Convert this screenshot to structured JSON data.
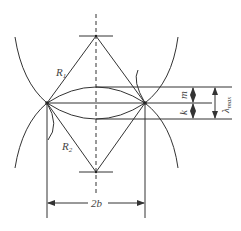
{
  "diagram": {
    "labels": {
      "r1": "R",
      "r1_sub": "1",
      "r2": "R",
      "r2_sub": "2",
      "width": "2b",
      "m": "m",
      "k": "k",
      "lambda": "λ",
      "lambda_sub": "max"
    },
    "colors": {
      "line": "#333333",
      "text": "#444444",
      "background": "#ffffff"
    }
  }
}
